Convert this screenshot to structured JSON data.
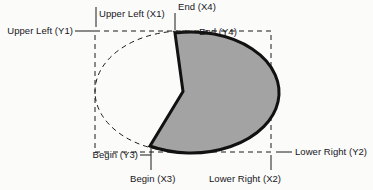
{
  "diagram": {
    "type": "geometry-annotation",
    "canvas": {
      "width": 373,
      "height": 190,
      "background": "#fbfbfa"
    },
    "colors": {
      "fill": "#a3a3a3",
      "outline": "#111111",
      "dashed_guide": "#1a1a1a",
      "label_text": "#16161a",
      "leader_line": "#1a1a1a"
    },
    "bounding_box": {
      "x1": 95,
      "y1": 31,
      "x2": 271,
      "y2": 152,
      "style": "dashed"
    },
    "ellipse_guide": {
      "cx": 183,
      "cy": 91.5,
      "rx": 88,
      "ry": 60.5,
      "style": "dashed"
    },
    "pie_wedge": {
      "center_x": 183,
      "center_y": 91.5,
      "begin_x": 150,
      "begin_y": 146,
      "end_x": 175,
      "end_y": 33,
      "fill": "#a3a3a3",
      "stroke": "#111111",
      "stroke_width": 3
    },
    "labels": [
      {
        "id": "upper-left-y1",
        "text": "Upper Left (Y1)",
        "marker": "leader-horizontal"
      },
      {
        "id": "upper-left-x1",
        "text": "Upper Left (X1)",
        "marker": "tick-vertical"
      },
      {
        "id": "end-x4",
        "text": "End (X4)",
        "marker": "tick-vertical"
      },
      {
        "id": "end-y4",
        "text": "End (Y4)",
        "marker": "leader-horizontal"
      },
      {
        "id": "begin-y3",
        "text": "Begin (Y3)",
        "marker": "leader-horizontal"
      },
      {
        "id": "begin-x3",
        "text": "Begin (X3)",
        "marker": "tick-vertical"
      },
      {
        "id": "lower-right-x2",
        "text": "Lower Right (X2)",
        "marker": "tick-vertical"
      },
      {
        "id": "lower-right-y2",
        "text": "Lower Right (Y2)",
        "marker": "leader-horizontal"
      }
    ]
  }
}
